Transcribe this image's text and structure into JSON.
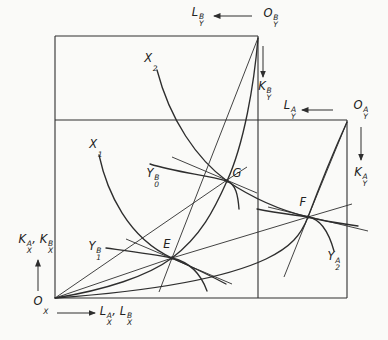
{
  "figure": {
    "background": "#fafaf8",
    "stroke_color": "#2e2e2e"
  },
  "labels": [
    {
      "id": "label-l-y-b",
      "parts": [
        {
          "base": "L",
          "sup": "B",
          "sub": "Y"
        }
      ],
      "x": 198,
      "y": 16
    },
    {
      "id": "label-o-y-b",
      "parts": [
        {
          "base": "O",
          "sup": "B",
          "sub": "Y"
        }
      ],
      "x": 271,
      "y": 17
    },
    {
      "id": "label-k-y-b",
      "parts": [
        {
          "base": "K",
          "sup": "B",
          "sub": "Y"
        }
      ],
      "x": 265,
      "y": 90
    },
    {
      "id": "label-l-y-a",
      "parts": [
        {
          "base": "L",
          "sup": "A",
          "sub": "Y"
        }
      ],
      "x": 290,
      "y": 109
    },
    {
      "id": "label-o-y-a",
      "parts": [
        {
          "base": "O",
          "sup": "A",
          "sub": "Y"
        }
      ],
      "x": 361,
      "y": 109
    },
    {
      "id": "label-k-y-a",
      "parts": [
        {
          "base": "K",
          "sup": "A",
          "sub": "Y"
        }
      ],
      "x": 361,
      "y": 176
    },
    {
      "id": "label-x2",
      "parts": [
        {
          "base": "X",
          "sub": "2"
        }
      ],
      "x": 151,
      "y": 62
    },
    {
      "id": "label-x1",
      "parts": [
        {
          "base": "X",
          "sub": "1"
        }
      ],
      "x": 96,
      "y": 148
    },
    {
      "id": "label-y0-b",
      "parts": [
        {
          "base": "Y",
          "sup": "B",
          "sub": "0"
        }
      ],
      "x": 153,
      "y": 177
    },
    {
      "id": "label-y1-b",
      "parts": [
        {
          "base": "Y",
          "sup": "B",
          "sub": "1"
        }
      ],
      "x": 95,
      "y": 250
    },
    {
      "id": "label-y2-a",
      "parts": [
        {
          "base": "Y",
          "sup": "A",
          "sub": "2"
        }
      ],
      "x": 334,
      "y": 260
    },
    {
      "id": "label-point-g",
      "parts": [
        {
          "base": "G"
        }
      ],
      "x": 237,
      "y": 173
    },
    {
      "id": "label-point-e",
      "parts": [
        {
          "base": "E"
        }
      ],
      "x": 167,
      "y": 244
    },
    {
      "id": "label-point-f",
      "parts": [
        {
          "base": "F"
        }
      ],
      "x": 303,
      "y": 202
    },
    {
      "id": "label-o-x",
      "parts": [
        {
          "base": "O",
          "sub": "X"
        }
      ],
      "x": 41,
      "y": 305
    },
    {
      "id": "label-k-x-axis",
      "parts": [
        {
          "base": "K",
          "sup": "A",
          "sub": "X"
        },
        {
          "sep": ", "
        },
        {
          "base": "K",
          "sup": "B",
          "sub": "X"
        }
      ],
      "x": 36,
      "y": 243
    },
    {
      "id": "label-l-x-axis",
      "parts": [
        {
          "base": "L",
          "sup": "A",
          "sub": "X"
        },
        {
          "sep": ", "
        },
        {
          "base": "L",
          "sup": "B",
          "sub": "X"
        }
      ],
      "x": 116,
      "y": 315
    }
  ],
  "points": [
    {
      "id": "point-e",
      "letter": "E",
      "x": 172,
      "y": 258
    },
    {
      "id": "point-g",
      "letter": "G",
      "x": 227,
      "y": 181
    },
    {
      "id": "point-f",
      "letter": "F",
      "x": 308,
      "y": 217
    }
  ],
  "arrows": [
    {
      "id": "arrow-labor-y-b",
      "dir": "left"
    },
    {
      "id": "arrow-labor-y-a",
      "dir": "left"
    },
    {
      "id": "arrow-capital-y-b",
      "dir": "down"
    },
    {
      "id": "arrow-capital-y-a",
      "dir": "down"
    },
    {
      "id": "arrow-capital-x",
      "dir": "up"
    },
    {
      "id": "arrow-labor-x",
      "dir": "right"
    }
  ]
}
